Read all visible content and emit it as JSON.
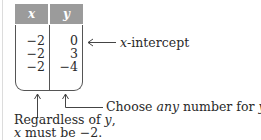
{
  "table": {
    "headers": {
      "x": "x",
      "y": "y"
    },
    "rows": [
      {
        "x": "−2",
        "y": "0"
      },
      {
        "x": "−2",
        "y": "3"
      },
      {
        "x": "−2",
        "y": "−4"
      }
    ],
    "header_color": "#9b9b9b"
  },
  "annotations": {
    "intercept": {
      "var": "x",
      "text": "-intercept"
    },
    "choose": {
      "pre": "Choose ",
      "emph": "any",
      "post": " number for ",
      "var": "y",
      "end": "."
    },
    "regardless": {
      "line1_pre": "Regardless of ",
      "line1_var": "y",
      "line1_end": ",",
      "line2_var": "x",
      "line2_rest": " must be −2."
    }
  }
}
